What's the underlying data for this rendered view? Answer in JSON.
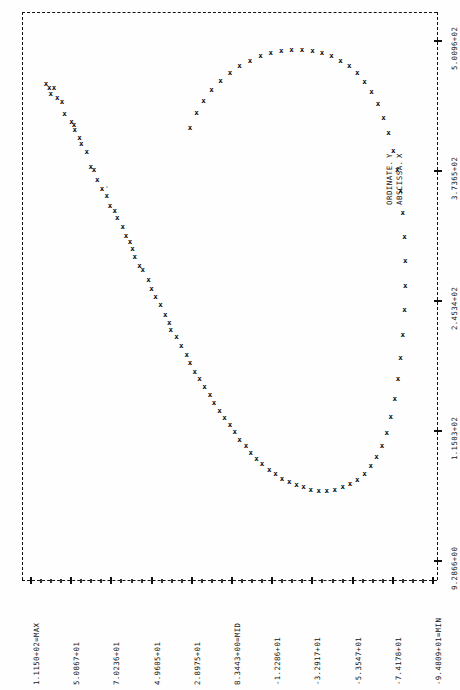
{
  "plot": {
    "orientation": "landscape-rotated",
    "marker_glyph": "x",
    "background": "#fefefe",
    "ink": "#111111"
  },
  "legend": {
    "position": "right-center",
    "entries": [
      {
        "label": "ORDINATE.",
        "symbol": "Y"
      },
      {
        "label": "ABSCISSA.",
        "symbol": "X"
      }
    ]
  },
  "left_axis": {
    "name": "ordinate-axis",
    "labels": [
      "1.1150+02=MAX",
      "5.0867+01",
      "7.0236+01",
      "4.9605+01",
      "2.8975+01",
      "8.3443+00=MID",
      "-1.2286+01",
      "-3.2917+01",
      "-5.3547+01",
      "-7.4178+01",
      "-9.4809+01=MIN"
    ]
  },
  "bottom_axis": {
    "name": "abscissa-axis",
    "labels": [
      "9.2866+00",
      "1.1503+02",
      "2.4534+02",
      "3.7365+02",
      "5.0096+02"
    ]
  },
  "chart_data": {
    "type": "scatter",
    "title": "",
    "subtitle": "",
    "xlabel": "ABSCISSA. X",
    "ylabel": "ORDINATE. Y",
    "grid": false,
    "legend_position": "right",
    "xlim": [
      9.2866,
      500.96
    ],
    "ylim": [
      -94.809,
      111.5
    ],
    "xticks": [
      9.2866,
      115.03,
      245.34,
      373.65,
      500.96
    ],
    "yticks": [
      111.5,
      50.867,
      70.236,
      49.605,
      28.975,
      8.3443,
      -12.286,
      -32.917,
      -53.547,
      -74.178,
      -94.809
    ],
    "ymax_label": "1.1150+02=MAX",
    "ymid_label": "8.3443+00=MID",
    "ymin_label": "-9.4809+01=MIN",
    "series": [
      {
        "name": "ORDINATE. Y",
        "marker": "x",
        "points": [
          [
            0.04,
            0.118
          ],
          [
            0.048,
            0.124
          ],
          [
            0.06,
            0.124
          ],
          [
            0.052,
            0.136
          ],
          [
            0.068,
            0.142
          ],
          [
            0.08,
            0.15
          ],
          [
            0.086,
            0.172
          ],
          [
            0.104,
            0.186
          ],
          [
            0.11,
            0.192
          ],
          [
            0.112,
            0.2
          ],
          [
            0.124,
            0.214
          ],
          [
            0.128,
            0.226
          ],
          [
            0.142,
            0.24
          ],
          [
            0.152,
            0.266
          ],
          [
            0.16,
            0.272
          ],
          [
            0.168,
            0.29
          ],
          [
            0.18,
            0.306
          ],
          [
            0.192,
            0.318
          ],
          [
            0.2,
            0.336
          ],
          [
            0.212,
            0.346
          ],
          [
            0.218,
            0.358
          ],
          [
            0.232,
            0.374
          ],
          [
            0.24,
            0.39
          ],
          [
            0.25,
            0.402
          ],
          [
            0.256,
            0.414
          ],
          [
            0.262,
            0.428
          ],
          [
            0.274,
            0.444
          ],
          [
            0.282,
            0.452
          ],
          [
            0.296,
            0.47
          ],
          [
            0.304,
            0.486
          ],
          [
            0.314,
            0.5
          ],
          [
            0.326,
            0.514
          ],
          [
            0.338,
            0.532
          ],
          [
            0.348,
            0.546
          ],
          [
            0.352,
            0.56
          ],
          [
            0.366,
            0.572
          ],
          [
            0.378,
            0.588
          ],
          [
            0.392,
            0.604
          ],
          [
            0.4,
            0.618
          ],
          [
            0.412,
            0.634
          ],
          [
            0.424,
            0.648
          ],
          [
            0.436,
            0.662
          ],
          [
            0.45,
            0.676
          ],
          [
            0.46,
            0.69
          ],
          [
            0.474,
            0.704
          ],
          [
            0.486,
            0.718
          ],
          [
            0.5,
            0.73
          ],
          [
            0.512,
            0.742
          ],
          [
            0.524,
            0.756
          ],
          [
            0.54,
            0.768
          ],
          [
            0.552,
            0.78
          ],
          [
            0.566,
            0.79
          ],
          [
            0.58,
            0.8
          ],
          [
            0.598,
            0.81
          ],
          [
            0.614,
            0.818
          ],
          [
            0.63,
            0.826
          ],
          [
            0.648,
            0.832
          ],
          [
            0.666,
            0.838
          ],
          [
            0.684,
            0.842
          ],
          [
            0.702,
            0.846
          ],
          [
            0.722,
            0.848
          ],
          [
            0.742,
            0.848
          ],
          [
            0.762,
            0.846
          ],
          [
            0.782,
            0.842
          ],
          [
            0.8,
            0.836
          ],
          [
            0.818,
            0.828
          ],
          [
            0.836,
            0.818
          ],
          [
            0.852,
            0.804
          ],
          [
            0.866,
            0.788
          ],
          [
            0.88,
            0.768
          ],
          [
            0.892,
            0.744
          ],
          [
            0.902,
            0.716
          ],
          [
            0.912,
            0.684
          ],
          [
            0.92,
            0.648
          ],
          [
            0.926,
            0.61
          ],
          [
            0.932,
            0.568
          ],
          [
            0.936,
            0.524
          ],
          [
            0.938,
            0.48
          ],
          [
            0.938,
            0.436
          ],
          [
            0.936,
            0.392
          ],
          [
            0.932,
            0.35
          ],
          [
            0.926,
            0.31
          ],
          [
            0.918,
            0.272
          ],
          [
            0.908,
            0.238
          ],
          [
            0.896,
            0.206
          ],
          [
            0.884,
            0.178
          ],
          [
            0.87,
            0.154
          ],
          [
            0.854,
            0.132
          ],
          [
            0.836,
            0.114
          ],
          [
            0.818,
            0.098
          ],
          [
            0.798,
            0.086
          ],
          [
            0.776,
            0.076
          ],
          [
            0.754,
            0.068
          ],
          [
            0.73,
            0.062
          ],
          [
            0.706,
            0.058
          ],
          [
            0.68,
            0.056
          ],
          [
            0.654,
            0.056
          ],
          [
            0.628,
            0.058
          ],
          [
            0.602,
            0.062
          ],
          [
            0.576,
            0.068
          ],
          [
            0.55,
            0.076
          ],
          [
            0.524,
            0.086
          ],
          [
            0.5,
            0.098
          ],
          [
            0.476,
            0.112
          ],
          [
            0.454,
            0.128
          ],
          [
            0.434,
            0.148
          ],
          [
            0.416,
            0.17
          ],
          [
            0.4,
            0.196
          ]
        ]
      }
    ]
  }
}
